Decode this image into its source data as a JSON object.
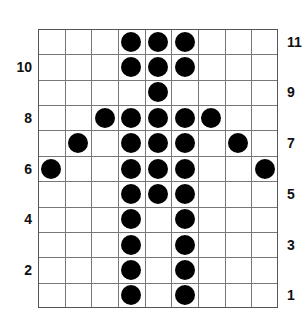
{
  "grid": {
    "columns": 9,
    "rows": 11,
    "line_color": "#777777",
    "dot_color": "#000000",
    "filled_cells_by_row": {
      "11": [
        4,
        5,
        6
      ],
      "10": [
        4,
        5,
        6
      ],
      "9": [
        5
      ],
      "8": [
        3,
        4,
        5,
        6,
        7
      ],
      "7": [
        2,
        4,
        5,
        6,
        8
      ],
      "6": [
        1,
        4,
        5,
        6,
        9
      ],
      "5": [
        4,
        5,
        6
      ],
      "4": [
        4,
        6
      ],
      "3": [
        4,
        6
      ],
      "2": [
        4,
        6
      ],
      "1": [
        4,
        6
      ]
    }
  },
  "row_labels": {
    "left": [
      {
        "row": 10,
        "text": "10"
      },
      {
        "row": 8,
        "text": "8"
      },
      {
        "row": 6,
        "text": "6"
      },
      {
        "row": 4,
        "text": "4"
      },
      {
        "row": 2,
        "text": "2"
      }
    ],
    "right": [
      {
        "row": 11,
        "text": "11"
      },
      {
        "row": 9,
        "text": "9"
      },
      {
        "row": 7,
        "text": "7"
      },
      {
        "row": 5,
        "text": "5"
      },
      {
        "row": 3,
        "text": "3"
      },
      {
        "row": 1,
        "text": "1"
      }
    ]
  }
}
